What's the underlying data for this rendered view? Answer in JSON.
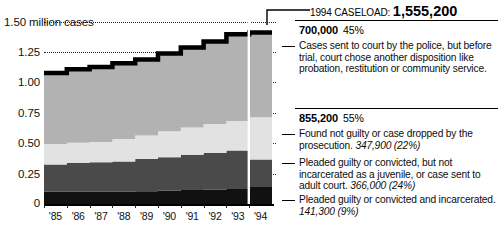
{
  "chart_data": {
    "type": "area",
    "stacked": true,
    "title": "",
    "xlabel": "",
    "ylabel": "million cases",
    "ylim": [
      0,
      1.5
    ],
    "grid": true,
    "ytick_labels": [
      "1.50 million cases",
      "1.25",
      "1.00",
      "0.75",
      "0.50",
      "0.25",
      "0"
    ],
    "ytick_values": [
      1.5,
      1.25,
      1.0,
      0.75,
      0.5,
      0.25,
      0
    ],
    "categories": [
      "'85",
      "'86",
      "'87",
      "'88",
      "'89",
      "'90",
      "'91",
      "'92",
      "'93",
      "'94"
    ],
    "series": [
      {
        "name": "Pleaded guilty or convicted and incarcerated",
        "color": "#111111",
        "values": [
          0.1,
          0.1,
          0.1,
          0.1,
          0.105,
          0.11,
          0.115,
          0.12,
          0.13,
          0.141
        ]
      },
      {
        "name": "Pleaded guilty or convicted, but not incarcerated as a juvenile, or case sent to adult court",
        "color": "#4a4a4a",
        "values": [
          0.225,
          0.24,
          0.245,
          0.25,
          0.265,
          0.275,
          0.29,
          0.3,
          0.31,
          0.225
        ]
      },
      {
        "name": "Found not guilty or case dropped by the prosecution",
        "color": "#e2e2e2",
        "values": [
          0.17,
          0.165,
          0.165,
          0.185,
          0.195,
          0.215,
          0.225,
          0.24,
          0.245,
          0.348
        ]
      },
      {
        "name": "Cases sent to court by the police, but before trial, court chose another disposition like probation, restitution or community service",
        "color": "#b2b2b2",
        "values": [
          0.585,
          0.605,
          0.62,
          0.625,
          0.625,
          0.64,
          0.66,
          0.68,
          0.715,
          0.7
        ]
      }
    ],
    "totals": [
      1.08,
      1.11,
      1.13,
      1.16,
      1.19,
      1.24,
      1.29,
      1.34,
      1.4,
      1.4142
    ]
  },
  "callout": {
    "caseload_label": "1994 CASELOAD:",
    "caseload_value": "1,555,200",
    "groups": [
      {
        "amount": "700,000",
        "percent": "45%",
        "description": "Cases sent to court by the police, but before trial, court chose another disposition like probation, restitution or community service."
      },
      {
        "amount": "855,200",
        "percent": "55%"
      }
    ],
    "items": [
      {
        "text": "Found not guilty or case dropped by the prosecution.",
        "number": "347,900",
        "number_pct": "(22%)"
      },
      {
        "text": "Pleaded guilty or convicted, but not incarcerated as a juvenile, or case sent to adult court.",
        "number": "366,000",
        "number_pct": "(24%)"
      },
      {
        "text": "Pleaded guilty or convicted and incarcerated.",
        "number": "141,300",
        "number_pct": "(9%)"
      }
    ]
  }
}
